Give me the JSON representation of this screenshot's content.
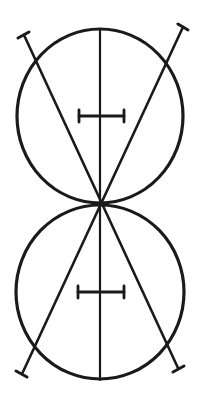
{
  "diagram": {
    "colors": {
      "ink": "#1a1a1a",
      "background": "#ffffff"
    },
    "stroke_widths": {
      "circle": 3.2,
      "axis": 2.2,
      "diagonal": 2.6,
      "cap": 3.0,
      "crossbar": 2.8
    },
    "circles": [
      {
        "name": "top-circle",
        "cx": 100,
        "cy": 116,
        "rx": 83,
        "ry": 87
      },
      {
        "name": "bottom-circle",
        "cx": 100,
        "cy": 292,
        "rx": 84,
        "ry": 87
      }
    ],
    "axis": {
      "x1": 100,
      "y1": 29,
      "x2": 100,
      "y2": 380
    },
    "diagonals": [
      {
        "name": "diagonal-left-top-to-right-bottom",
        "x1": 24,
        "y1": 35,
        "x2": 178,
        "y2": 368
      },
      {
        "name": "diagonal-right-top-to-left-bottom",
        "x1": 183,
        "y1": 27,
        "x2": 22,
        "y2": 374
      }
    ],
    "caps": [
      {
        "name": "cap-top-left",
        "x1": 18,
        "y1": 38,
        "x2": 29,
        "y2": 32
      },
      {
        "name": "cap-top-right",
        "x1": 178,
        "y1": 24,
        "x2": 188,
        "y2": 30
      },
      {
        "name": "cap-bottom-left",
        "x1": 16,
        "y1": 371,
        "x2": 27,
        "y2": 377
      },
      {
        "name": "cap-bottom-right",
        "x1": 173,
        "y1": 372,
        "x2": 184,
        "y2": 366
      }
    ],
    "crossbars": [
      {
        "name": "crossbar-top",
        "bar": {
          "x1": 79,
          "y1": 116,
          "x2": 124,
          "y2": 116
        },
        "left_tick": {
          "x1": 79,
          "y1": 110,
          "x2": 79,
          "y2": 122
        },
        "right_tick": {
          "x1": 124,
          "y1": 110,
          "x2": 124,
          "y2": 122
        }
      },
      {
        "name": "crossbar-bottom",
        "bar": {
          "x1": 78,
          "y1": 292,
          "x2": 124,
          "y2": 292
        },
        "left_tick": {
          "x1": 78,
          "y1": 286,
          "x2": 78,
          "y2": 298
        },
        "right_tick": {
          "x1": 124,
          "y1": 286,
          "x2": 124,
          "y2": 298
        }
      }
    ]
  }
}
